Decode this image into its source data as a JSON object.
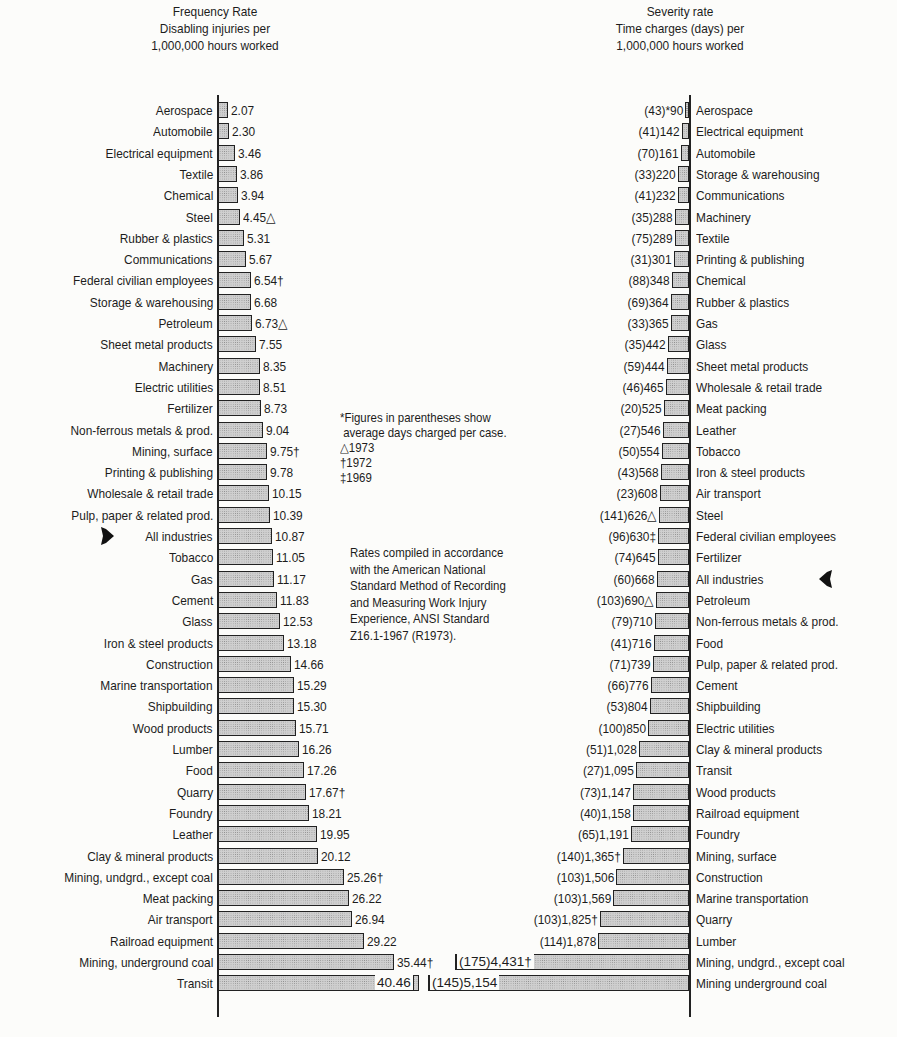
{
  "chart_data": [
    {
      "type": "bar",
      "orientation": "horizontal",
      "title": "Frequency Rate",
      "subtitle": [
        "Disabling injuries per",
        "1,000,000 hours worked"
      ],
      "xlabel": "Disabling injuries per 1,000,000 hours worked",
      "highlight": "All industries",
      "categories": [
        "Aerospace",
        "Automobile",
        "Electrical equipment",
        "Textile",
        "Chemical",
        "Steel",
        "Rubber & plastics",
        "Communications",
        "Federal civilian employees",
        "Storage & warehousing",
        "Petroleum",
        "Sheet metal products",
        "Machinery",
        "Electric utilities",
        "Fertilizer",
        "Non-ferrous metals & prod.",
        "Mining, surface",
        "Printing & publishing",
        "Wholesale & retail trade",
        "Pulp, paper & related prod.",
        "All industries",
        "Tobacco",
        "Gas",
        "Cement",
        "Glass",
        "Iron & steel products",
        "Construction",
        "Marine transportation",
        "Shipbuilding",
        "Wood products",
        "Lumber",
        "Food",
        "Quarry",
        "Foundry",
        "Leather",
        "Clay & mineral products",
        "Mining, undgrd., except coal",
        "Meat packing",
        "Air transport",
        "Railroad equipment",
        "Mining, underground coal",
        "Transit"
      ],
      "values": [
        2.07,
        2.3,
        3.46,
        3.86,
        3.94,
        4.45,
        5.31,
        5.67,
        6.54,
        6.68,
        6.73,
        7.55,
        8.35,
        8.51,
        8.73,
        9.04,
        9.75,
        9.78,
        10.15,
        10.39,
        10.87,
        11.05,
        11.17,
        11.83,
        12.53,
        13.18,
        14.66,
        15.29,
        15.3,
        15.71,
        16.26,
        17.26,
        17.67,
        18.21,
        19.95,
        20.12,
        25.26,
        26.22,
        26.94,
        29.22,
        35.44,
        40.46
      ],
      "value_labels": [
        "2.07",
        "2.30",
        "3.46",
        "3.86",
        "3.94",
        "4.45△",
        "5.31",
        "5.67",
        "6.54†",
        "6.68",
        "6.73△",
        "7.55",
        "8.35",
        "8.51",
        "8.73",
        "9.04",
        "9.75†",
        "9.78",
        "10.15",
        "10.39",
        "10.87",
        "11.05",
        "11.17",
        "11.83",
        "12.53",
        "13.18",
        "14.66",
        "15.29",
        "15.30",
        "15.71",
        "16.26",
        "17.26",
        "17.67†",
        "18.21",
        "19.95",
        "20.12",
        "25.26†",
        "26.22",
        "26.94",
        "29.22",
        "35.44†",
        "40.46"
      ]
    },
    {
      "type": "bar",
      "orientation": "horizontal",
      "title": "Severity rate",
      "subtitle": [
        "Time charges (days) per",
        "1,000,000 hours worked"
      ],
      "xlabel": "Time charges (days) per 1,000,000 hours worked",
      "highlight": "All industries",
      "categories": [
        "Aerospace",
        "Electrical equipment",
        "Automobile",
        "Storage & warehousing",
        "Communications",
        "Machinery",
        "Textile",
        "Printing & publishing",
        "Chemical",
        "Rubber & plastics",
        "Gas",
        "Glass",
        "Sheet metal products",
        "Wholesale & retail trade",
        "Meat packing",
        "Leather",
        "Tobacco",
        "Iron & steel products",
        "Air transport",
        "Steel",
        "Federal civilian employees",
        "Fertilizer",
        "All industries",
        "Petroleum",
        "Non-ferrous metals & prod.",
        "Food",
        "Pulp, paper & related prod.",
        "Cement",
        "Shipbuilding",
        "Electric utilities",
        "Clay & mineral products",
        "Transit",
        "Wood products",
        "Railroad equipment",
        "Foundry",
        "Mining, surface",
        "Construction",
        "Marine transportation",
        "Quarry",
        "Lumber",
        "Mining, undgrd., except coal",
        "Mining  underground coal"
      ],
      "values": [
        90,
        142,
        161,
        220,
        232,
        288,
        289,
        301,
        348,
        364,
        365,
        442,
        444,
        465,
        525,
        546,
        554,
        568,
        608,
        626,
        630,
        645,
        668,
        690,
        710,
        716,
        739,
        776,
        804,
        850,
        1028,
        1095,
        1147,
        1158,
        1191,
        1365,
        1506,
        1569,
        1825,
        1878,
        4431,
        5154
      ],
      "avg_days_per_case": [
        43,
        41,
        70,
        33,
        41,
        35,
        75,
        31,
        88,
        69,
        33,
        35,
        59,
        46,
        20,
        27,
        50,
        43,
        23,
        141,
        96,
        74,
        60,
        103,
        79,
        41,
        71,
        66,
        53,
        100,
        51,
        27,
        73,
        40,
        65,
        140,
        103,
        103,
        103,
        114,
        175,
        145
      ],
      "value_labels": [
        "(43)*90",
        "(41)142",
        "(70)161",
        "(33)220",
        "(41)232",
        "(35)288",
        "(75)289",
        "(31)301",
        "(88)348",
        "(69)364",
        "(33)365",
        "(35)442",
        "(59)444",
        "(46)465",
        "(20)525",
        "(27)546",
        "(50)554",
        "(43)568",
        "(23)608",
        "(141)626△",
        "(96)630‡",
        "(74)645",
        "(60)668",
        "(103)690△",
        "(79)710",
        "(41)716",
        "(71)739",
        "(66)776",
        "(53)804",
        "(100)850",
        "(51)1,028",
        "(27)1,095",
        "(73)1,147",
        "(40)1,158",
        "(65)1,191",
        "(140)1,365†",
        "(103)1,506",
        "(103)1,569",
        "(103)1,825†",
        "(114)1,878",
        "(175)4,431†",
        "(145)5,154"
      ]
    }
  ],
  "titles": {
    "left": [
      "Frequency Rate",
      "Disabling injuries per",
      "1,000,000 hours worked"
    ],
    "right": [
      "Severity rate",
      "Time charges (days) per",
      "1,000,000 hours worked"
    ]
  },
  "notes": {
    "footnote": [
      "*Figures in parentheses show",
      " average days charged per case.",
      "△1973",
      "†1972",
      "‡1969"
    ],
    "standard": [
      "Rates compiled in accordance",
      "with the American National",
      "Standard Method of Recording",
      "and Measuring Work Injury",
      "Experience, ANSI Standard",
      "Z16.1-1967 (R1973)."
    ]
  },
  "colors": {
    "bar_fill": "#cfcfcf",
    "bar_stroke": "#222222",
    "text": "#1c1c1c",
    "background": "#fcfcfa"
  }
}
